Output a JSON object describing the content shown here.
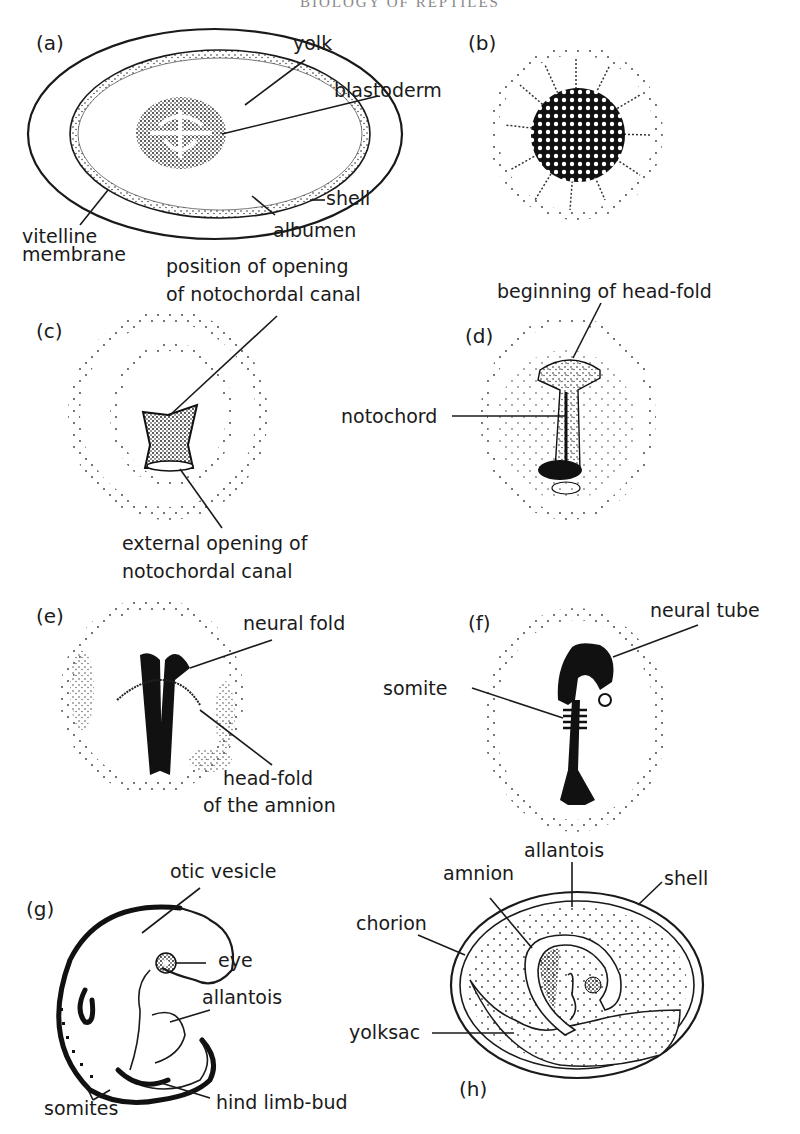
{
  "page": {
    "running_header": "BIOLOGY OF REPTILES"
  },
  "figure": {
    "panels": [
      {
        "id": "a",
        "label": "(a)",
        "annotations": {
          "yolk": "yolk",
          "blastoderm": "blastoderm",
          "shell": "shell",
          "albumen": "albumen",
          "vitelline_line1": "vitelline",
          "vitelline_line2": "membrane"
        }
      },
      {
        "id": "b",
        "label": "(b)",
        "annotations": {}
      },
      {
        "id": "c",
        "label": "(c)",
        "annotations": {
          "position_line1": "position of opening",
          "position_line2": "of notochordal canal",
          "external_line1": "external opening of",
          "external_line2": "notochordal canal"
        }
      },
      {
        "id": "d",
        "label": "(d)",
        "annotations": {
          "headfold": "beginning of head-fold",
          "notochord": "notochord"
        }
      },
      {
        "id": "e",
        "label": "(e)",
        "annotations": {
          "neural_fold": "neural fold",
          "headfold_line1": "head-fold",
          "headfold_line2": "of the amnion"
        }
      },
      {
        "id": "f",
        "label": "(f)",
        "annotations": {
          "neural_tube": "neural tube",
          "somite": "somite"
        }
      },
      {
        "id": "g",
        "label": "(g)",
        "annotations": {
          "otic_vesicle": "otic vesicle",
          "eye": "eye",
          "allantois": "allantois",
          "hind_limb_bud": "hind limb-bud",
          "somites": "somites"
        }
      },
      {
        "id": "h",
        "label": "(h)",
        "annotations": {
          "allantois": "allantois",
          "amnion": "amnion",
          "shell": "shell",
          "chorion": "chorion",
          "yolksac": "yolksac"
        }
      }
    ]
  }
}
